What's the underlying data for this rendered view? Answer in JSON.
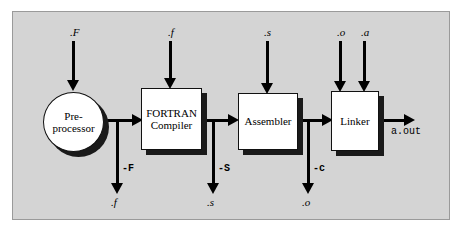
{
  "diagram": {
    "panel_color": "#d4d4d4",
    "line_color": "#000000",
    "node_fill": "#ffffff",
    "shadow_color": "#1a1a1a"
  },
  "nodes": {
    "preprocessor": {
      "line1": "Pre-",
      "line2": "processor"
    },
    "fortran_compiler": {
      "line1": "FORTRAN",
      "line2": "Compiler"
    },
    "assembler": {
      "label": "Assembler"
    },
    "linker": {
      "label": "Linker"
    }
  },
  "inputs": {
    "preprocessor_in": ".F",
    "compiler_in": ".f",
    "assembler_in": ".s",
    "linker_in_o": ".o",
    "linker_in_a": ".a"
  },
  "flags": {
    "preprocessor_stop": "-F",
    "compiler_stop": "-S",
    "assembler_stop": "-c"
  },
  "outputs": {
    "preprocessor_out": ".f",
    "compiler_out": ".s",
    "assembler_out": ".o",
    "final": "a.out"
  }
}
